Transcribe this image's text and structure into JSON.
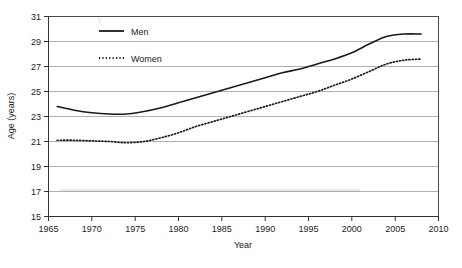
{
  "chart_data": {
    "type": "line",
    "title": "",
    "xlabel": "Year",
    "ylabel": "Age (years)",
    "xlim": [
      1965,
      2010
    ],
    "ylim": [
      15,
      31
    ],
    "xticks": [
      1965,
      1970,
      1975,
      1980,
      1985,
      1990,
      1995,
      2000,
      2005,
      2010
    ],
    "yticks": [
      15,
      17,
      19,
      21,
      23,
      25,
      27,
      29,
      31
    ],
    "grid": "horizontal",
    "legend_position": "top-left-inside",
    "series": [
      {
        "name": "Men",
        "style": "solid",
        "color": "#1a1a1a",
        "x": [
          1966,
          1968,
          1970,
          1972,
          1974,
          1976,
          1978,
          1980,
          1982,
          1984,
          1986,
          1988,
          1990,
          1992,
          1994,
          1996,
          1998,
          2000,
          2002,
          2004,
          2006,
          2008
        ],
        "values": [
          23.8,
          23.5,
          23.3,
          23.2,
          23.2,
          23.4,
          23.7,
          24.1,
          24.5,
          24.9,
          25.3,
          25.7,
          26.1,
          26.5,
          26.8,
          27.2,
          27.6,
          28.1,
          28.8,
          29.4,
          29.6,
          29.6
        ]
      },
      {
        "name": "Women",
        "style": "dotted",
        "color": "#1a1a1a",
        "x": [
          1966,
          1968,
          1970,
          1972,
          1974,
          1976,
          1978,
          1980,
          1982,
          1984,
          1986,
          1988,
          1990,
          1992,
          1994,
          1996,
          1998,
          2000,
          2002,
          2004,
          2006,
          2008
        ],
        "values": [
          21.1,
          21.1,
          21.05,
          21.0,
          20.9,
          21.0,
          21.3,
          21.7,
          22.2,
          22.6,
          23.0,
          23.4,
          23.8,
          24.2,
          24.6,
          25.0,
          25.5,
          26.0,
          26.6,
          27.2,
          27.5,
          27.6
        ]
      }
    ]
  },
  "axis": {
    "y_title": "Age (years)",
    "x_title": "Year",
    "y_tick_labels": [
      "31",
      "29",
      "27",
      "25",
      "23",
      "21",
      "19",
      "17",
      "15"
    ],
    "x_tick_labels": [
      "1965",
      "1970",
      "1975",
      "1980",
      "1985",
      "1990",
      "1995",
      "2000",
      "2005",
      "2010"
    ]
  },
  "legend": {
    "items": [
      {
        "label": "Men",
        "style": "solid"
      },
      {
        "label": "Women",
        "style": "dotted"
      }
    ]
  },
  "colors": {
    "grid": "#b0b0b0",
    "border": "#4a4a4a",
    "line": "#1a1a1a",
    "text": "#222222",
    "background": "#ffffff"
  }
}
